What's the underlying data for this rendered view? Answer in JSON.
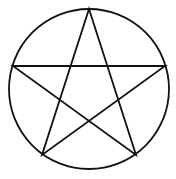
{
  "figure": {
    "caption": "Five-pointed star drawn as one continuous path inside a circle",
    "background_color": "#ffffff",
    "canvas": {
      "width": 176,
      "height": 179
    },
    "circle": {
      "name": "circumscribed-circle",
      "center_x": 89,
      "center_y": 89,
      "radius": 80,
      "stroke_color": "#111111",
      "stroke_width": 1.8,
      "fill": "none"
    },
    "star": {
      "name": "pentagram",
      "point_count": 5,
      "orientation": "point-up",
      "stroke_color": "#111111",
      "stroke_width": 1.8,
      "fill": "none",
      "closed": true,
      "vertices": [
        {
          "label": "top",
          "x": 89,
          "y": 9
        },
        {
          "label": "right",
          "x": 165,
          "y": 66
        },
        {
          "label": "bottom-right",
          "x": 136,
          "y": 155
        },
        {
          "label": "bottom-left",
          "x": 42,
          "y": 155
        },
        {
          "label": "left",
          "x": 13,
          "y": 66
        }
      ],
      "path_order": [
        0,
        2,
        4,
        1,
        3
      ]
    }
  },
  "chart_data": {
    "type": "scatter",
    "xlabel": "",
    "ylabel": "",
    "xlim": [
      0,
      176
    ],
    "ylim": [
      0,
      179
    ],
    "grid": false,
    "legend": "none",
    "series": [
      {
        "name": "circle",
        "x": [
          89
        ],
        "y": [
          89
        ],
        "radius": 80
      },
      {
        "name": "star-vertices",
        "x": [
          89,
          165,
          136,
          42,
          13
        ],
        "y": [
          9,
          66,
          155,
          155,
          66
        ]
      }
    ],
    "annotations": []
  }
}
